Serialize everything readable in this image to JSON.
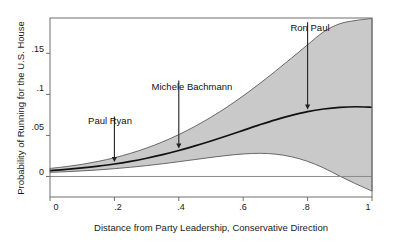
{
  "chart_data": {
    "type": "line",
    "title": "",
    "xlabel": "Distance from Party Leadership, Conservative Direction",
    "ylabel": "Probability of Running for the U.S. House",
    "xlim": [
      0,
      1
    ],
    "ylim": [
      -0.025,
      0.193
    ],
    "grid": false,
    "legend": "none",
    "xticks": [
      "0",
      ".2",
      ".4",
      ".6",
      ".8",
      "1"
    ],
    "xtick_values": [
      0,
      0.2,
      0.4,
      0.6,
      0.8,
      1
    ],
    "yticks": [
      "0",
      ".05",
      ".1",
      ".15"
    ],
    "ytick_values": [
      0,
      0.05,
      0.1,
      0.15
    ],
    "zero_reference_line": 0,
    "x": [
      0,
      0.05,
      0.1,
      0.15,
      0.2,
      0.25,
      0.3,
      0.35,
      0.4,
      0.45,
      0.5,
      0.55,
      0.6,
      0.65,
      0.7,
      0.75,
      0.8,
      0.85,
      0.9,
      0.95,
      1
    ],
    "series": [
      {
        "name": "Predicted probability",
        "values": [
          0.0072,
          0.0086,
          0.0104,
          0.0126,
          0.0152,
          0.0184,
          0.0222,
          0.0266,
          0.0316,
          0.0372,
          0.0432,
          0.0496,
          0.0562,
          0.0628,
          0.069,
          0.0744,
          0.079,
          0.0822,
          0.0842,
          0.0849,
          0.0843
        ]
      },
      {
        "name": "Upper 95% confidence bound",
        "values": [
          0.0098,
          0.012,
          0.0148,
          0.0184,
          0.0228,
          0.0282,
          0.0346,
          0.0422,
          0.051,
          0.061,
          0.0722,
          0.0846,
          0.0982,
          0.1128,
          0.1282,
          0.1442,
          0.1604,
          0.1762,
          0.186,
          0.19,
          0.1925
        ]
      },
      {
        "name": "Lower 95% confidence bound",
        "values": [
          0.005,
          0.0058,
          0.0068,
          0.008,
          0.0095,
          0.0112,
          0.0132,
          0.0155,
          0.018,
          0.0206,
          0.0232,
          0.0256,
          0.0274,
          0.0282,
          0.0272,
          0.024,
          0.0184,
          0.0104,
          0.0004,
          -0.009,
          -0.0178
        ]
      }
    ],
    "annotations": [
      {
        "label": "Paul Ryan",
        "x": 0.2,
        "y": 0.0152,
        "label_x": 0.175,
        "label_y": 0.062
      },
      {
        "label": "Michele Bachmann",
        "x": 0.4,
        "y": 0.0316,
        "label_x": 0.42,
        "label_y": 0.106
      },
      {
        "label": "Ron Paul",
        "x": 0.8,
        "y": 0.079,
        "label_x": 0.815,
        "label_y": 0.177
      }
    ]
  },
  "axes": {
    "y_title": "Probability of Running for the U.S. House",
    "x_title": "Distance from Party Leadership, Conservative Direction",
    "x_tick_0": "0",
    "x_tick_1": ".2",
    "x_tick_2": ".4",
    "x_tick_3": ".6",
    "x_tick_4": ".8",
    "x_tick_5": "1",
    "y_tick_0": "0",
    "y_tick_1": ".05",
    "y_tick_2": ".1",
    "y_tick_3": ".15"
  },
  "annotations": {
    "a0": "Paul Ryan",
    "a1": "Michele Bachmann",
    "a2": "Ron Paul"
  },
  "colors": {
    "band_fill": "#c9c9c9",
    "band_stroke": "#5a5a5a",
    "fit_line": "#111111",
    "frame": "#6e6e6e",
    "text": "#1a1a1a",
    "background": "#ffffff"
  }
}
